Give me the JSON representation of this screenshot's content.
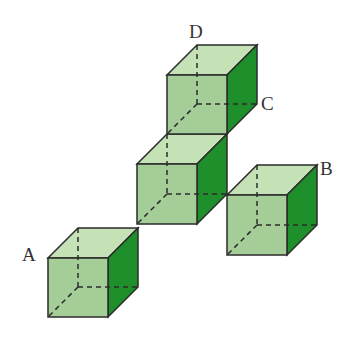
{
  "diagram": {
    "colors": {
      "front_face": "#9cc98f",
      "top_face": "#c4e2b5",
      "side_face": "#1e8f2a",
      "edge": "#2b2b2b",
      "hidden_edge": "#2b2b2b"
    },
    "labels": {
      "A": "A",
      "B": "B",
      "C": "C",
      "D": "D"
    },
    "cubes": [
      {
        "name": "cube-a",
        "fx": 48,
        "fy": 258
      },
      {
        "name": "cube-middle",
        "fx": 137,
        "fy": 164
      },
      {
        "name": "cube-top",
        "fx": 167,
        "fy": 75
      },
      {
        "name": "cube-b",
        "fx": 227,
        "fy": 195
      }
    ]
  }
}
